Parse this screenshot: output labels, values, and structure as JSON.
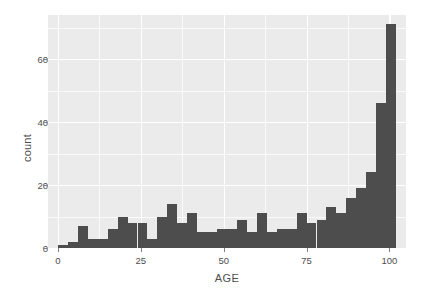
{
  "chart_data": {
    "type": "bar",
    "title": "",
    "subtitle": "",
    "xlabel": "AGE",
    "ylabel": "count",
    "xlim": [
      -3,
      105
    ],
    "ylim": [
      0,
      74
    ],
    "grid": true,
    "legend": null,
    "bin_width": 3,
    "bar_color": "#4d4d4d",
    "panel_color": "#ebebeb",
    "gridline_color": "#ffffff",
    "text_color": "#4d4d4d",
    "x_ticks": [
      {
        "value": 0,
        "label": "0"
      },
      {
        "value": 25,
        "label": "25"
      },
      {
        "value": 50,
        "label": "50"
      },
      {
        "value": 75,
        "label": "75"
      },
      {
        "value": 100,
        "label": "100"
      }
    ],
    "y_ticks": [
      {
        "value": 0,
        "label": "0"
      },
      {
        "value": 20,
        "label": "20"
      },
      {
        "value": 40,
        "label": "40"
      },
      {
        "value": 60,
        "label": "60"
      }
    ],
    "x_minor_ticks": [
      12.5,
      37.5,
      62.5,
      87.5
    ],
    "y_minor_ticks": [
      10,
      30,
      50,
      70
    ],
    "categories": [
      "0-3",
      "3-6",
      "6-9",
      "9-12",
      "12-15",
      "15-18",
      "18-21",
      "21-24",
      "24-27",
      "27-30",
      "30-33",
      "33-36",
      "36-39",
      "39-42",
      "42-45",
      "45-48",
      "48-51",
      "51-54",
      "54-57",
      "57-60",
      "60-63",
      "63-66",
      "66-69",
      "69-72",
      "72-75",
      "75-78",
      "78-81",
      "81-84",
      "84-87",
      "87-90",
      "90-93",
      "93-96",
      "96-99",
      "99-102"
    ],
    "bin_starts": [
      0,
      3,
      6,
      9,
      12,
      15,
      18,
      21,
      24,
      27,
      30,
      33,
      36,
      39,
      42,
      45,
      48,
      51,
      54,
      57,
      60,
      63,
      66,
      69,
      72,
      75,
      78,
      81,
      84,
      87,
      90,
      93,
      96,
      99
    ],
    "values": [
      1,
      2,
      7,
      3,
      3,
      6,
      10,
      8,
      8,
      3,
      10,
      14,
      8,
      11,
      5,
      5,
      6,
      6,
      9,
      5,
      11,
      5,
      6,
      6,
      11,
      8,
      9,
      13,
      11,
      16,
      19,
      24,
      46,
      71
    ]
  }
}
